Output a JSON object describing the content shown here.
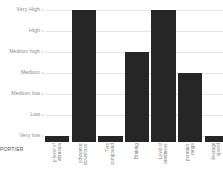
{
  "corner": {
    "caption": "PORTIER"
  },
  "chart_data": {
    "type": "bar",
    "title": "",
    "subtitle": "",
    "xlabel": "",
    "ylabel": "",
    "grid": true,
    "legend": false,
    "orientation": "vertical",
    "bar_color": "#262626",
    "gridline_color": "#e6e6e6",
    "tick_label_color": "#8b8b8b",
    "background": "#ffffff",
    "y_scale": "ordinal",
    "y_tick_labels": [
      "Very High",
      "High",
      "Medium high",
      "Medium",
      "Medium low",
      "Low",
      "Very low"
    ],
    "y_level_values": [
      7,
      6,
      5,
      4,
      3,
      2,
      1
    ],
    "categories": [
      "Grip level of abrasion",
      "Aerodynamic downforce",
      "Tyre compound",
      "Braking",
      "Level of windiness",
      "Temperature range",
      "Average speed"
    ],
    "category_lines": [
      [
        "p level of",
        "abrasion"
      ],
      [
        "odynamic",
        "downforce"
      ],
      [
        "Tyre",
        "compound"
      ],
      [
        "Braking"
      ],
      [
        "Level of",
        "windiness"
      ],
      [
        "perature",
        "range"
      ],
      [
        "Average",
        "speed"
      ]
    ],
    "values": [
      "Very low",
      "Very High",
      "Very low",
      "Medium high",
      "Very High",
      "Medium",
      "Very low"
    ],
    "numeric_values": [
      1,
      7,
      1,
      5,
      7,
      4,
      1
    ],
    "ylim": [
      0,
      7
    ]
  }
}
